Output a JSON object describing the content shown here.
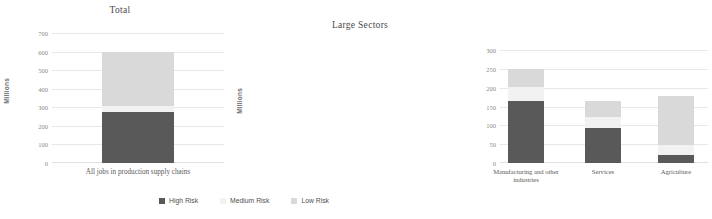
{
  "colors": {
    "high_risk": "#595959",
    "medium_risk": "#F2F2F2",
    "low_risk": "#D9D9D9",
    "gridline": "#E8E8E8",
    "text": "#595959"
  },
  "legend": {
    "items": [
      {
        "label": "High Risk",
        "color": "#595959"
      },
      {
        "label": "Medium Risk",
        "color": "#F2F2F2"
      },
      {
        "label": "Low Risk",
        "color": "#D9D9D9"
      }
    ]
  },
  "chart_data": [
    {
      "type": "bar",
      "id": "total",
      "title": "Total",
      "xlabel": "",
      "ylabel": "Millions",
      "stacked": true,
      "grid": true,
      "legend_position": "bottom",
      "ylim": [
        0,
        700
      ],
      "yticks": [
        0,
        100,
        200,
        300,
        400,
        500,
        600,
        700
      ],
      "categories": [
        "All jobs in production supply chains"
      ],
      "series": [
        {
          "name": "High Risk",
          "values": [
            275
          ]
        },
        {
          "name": "Medium Risk",
          "values": [
            30
          ]
        },
        {
          "name": "Low Risk",
          "values": [
            295
          ]
        }
      ],
      "totals": [
        600
      ]
    },
    {
      "type": "bar",
      "id": "large_sectors",
      "title": "Large Sectors",
      "xlabel": "",
      "ylabel": "Millions",
      "stacked": true,
      "grid": true,
      "legend_position": "bottom",
      "ylim": [
        0,
        300
      ],
      "yticks": [
        0,
        50,
        100,
        150,
        200,
        250,
        300
      ],
      "categories": [
        "Manufacturing and other industries",
        "Services",
        "Agriculture"
      ],
      "series": [
        {
          "name": "High Risk",
          "values": [
            165,
            93,
            22
          ]
        },
        {
          "name": "Medium Risk",
          "values": [
            38,
            30,
            25
          ]
        },
        {
          "name": "Low Risk",
          "values": [
            47,
            42,
            131
          ]
        }
      ],
      "totals": [
        250,
        165,
        178
      ]
    }
  ]
}
